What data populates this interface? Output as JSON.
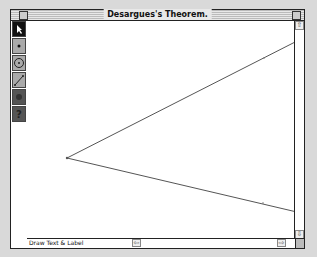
{
  "window": {
    "title": "Desargues's Theorem."
  },
  "toolbox": {
    "tools": [
      {
        "name": "arrow-tool",
        "icon": "arrow-pointer-icon",
        "selected": true
      },
      {
        "name": "point-tool",
        "icon": "point-icon",
        "selected": false
      },
      {
        "name": "compass-tool",
        "icon": "circle-icon",
        "selected": false
      },
      {
        "name": "straightedge-tool",
        "icon": "segment-icon",
        "selected": false
      },
      {
        "name": "text-tool",
        "icon": "hand-icon",
        "selected": false
      },
      {
        "name": "info-tool",
        "icon": "question-icon",
        "selected": false
      }
    ]
  },
  "canvas": {
    "vertex": {
      "x": 40,
      "y": 137
    },
    "ray_upper_end": {
      "x": 274,
      "y": 18
    },
    "ray_lower_end": {
      "x": 274,
      "y": 192
    },
    "line_color": "#555555"
  },
  "statusbar": {
    "text": "Draw Text & Label"
  }
}
